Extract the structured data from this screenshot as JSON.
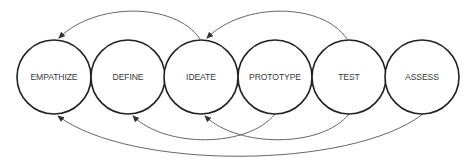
{
  "diagram": {
    "type": "design-thinking-process",
    "stages": [
      {
        "id": "empathize",
        "label": "EMPATHIZE",
        "cx": 54,
        "cy": 77,
        "r": 37
      },
      {
        "id": "define",
        "label": "DEFINE",
        "cx": 128,
        "cy": 77,
        "r": 37
      },
      {
        "id": "ideate",
        "label": "IDEATE",
        "cx": 201,
        "cy": 77,
        "r": 37
      },
      {
        "id": "prototype",
        "label": "PROTOTYPE",
        "cx": 275,
        "cy": 77,
        "r": 37
      },
      {
        "id": "test",
        "label": "TEST",
        "cx": 349,
        "cy": 77,
        "r": 37
      },
      {
        "id": "assess",
        "label": "ASSESS",
        "cx": 422,
        "cy": 77,
        "r": 37
      }
    ],
    "feedback_arrows": [
      {
        "from": "ideate",
        "to": "empathize",
        "side": "top",
        "path": "M 200 39 C 175 2, 95 2, 59 38"
      },
      {
        "from": "test",
        "to": "ideate",
        "side": "top",
        "path": "M 347 39 C 322 2, 243 2, 207 38"
      },
      {
        "from": "prototype",
        "to": "define",
        "side": "bottom",
        "path": "M 275 114 C 248 148, 165 148, 133 116"
      },
      {
        "from": "test",
        "to": "ideate",
        "side": "bottom",
        "path": "M 349 114 C 322 148, 238 148, 205 116"
      },
      {
        "from": "assess",
        "to": "empathize",
        "side": "bottom",
        "path": "M 423 114 C 350 170, 130 170, 58 116"
      }
    ],
    "colors": {
      "circle_stroke": "#222222",
      "arrow_stroke": "#555555",
      "label_text": "#3a3a3a",
      "background": "#ffffff"
    }
  }
}
